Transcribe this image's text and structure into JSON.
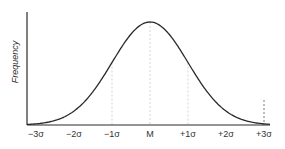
{
  "chart_data": {
    "type": "line",
    "title": "",
    "xlabel": "",
    "ylabel": "Frequency",
    "x_tick_labels": [
      "−3σ",
      "−2σ",
      "−1σ",
      "M",
      "+1σ",
      "+2σ",
      "+3σ"
    ],
    "x_tick_values": [
      -3,
      -2,
      -1,
      0,
      1,
      2,
      3
    ],
    "series": [
      {
        "name": "Normal distribution",
        "distribution": "gaussian",
        "mean": 0,
        "sd": 1,
        "x": [
          -3,
          -2.5,
          -2,
          -1.5,
          -1,
          -0.5,
          0,
          0.5,
          1,
          1.5,
          2,
          2.5,
          3
        ],
        "y": [
          0.011,
          0.044,
          0.135,
          0.325,
          0.607,
          0.882,
          1.0,
          0.882,
          0.607,
          0.325,
          0.135,
          0.044,
          0.011
        ]
      }
    ],
    "xlim": [
      -3.1,
      3.1
    ],
    "ylim": [
      0,
      1.1
    ],
    "guides": [
      {
        "x": -1,
        "style": "dotted"
      },
      {
        "x": 0,
        "style": "dotted"
      },
      {
        "x": 1,
        "style": "dotted"
      },
      {
        "x": 3,
        "style": "dashed"
      }
    ],
    "grid": false,
    "legend": "none"
  },
  "layout": {
    "origin_x": 27,
    "axis_y": 125,
    "axis_top": 12,
    "axis_right": 270,
    "mean_px": 150,
    "sigma_px": 38,
    "peak_y": 22
  }
}
